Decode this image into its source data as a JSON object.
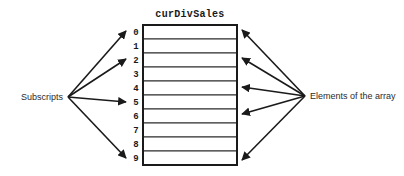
{
  "diagram": {
    "title": "curDivSales",
    "left_label": "Subscripts",
    "right_label": "Elements of the array",
    "subscripts": [
      "0",
      "1",
      "2",
      "3",
      "4",
      "5",
      "6",
      "7",
      "8",
      "9"
    ],
    "cell_count": 10,
    "colors": {
      "background": "#ffffff",
      "outline": "#1a1a1a",
      "cell_border": "#2b2b2b",
      "text": "#1a1a1a",
      "label_text": "#2b2b2b"
    },
    "left_pointer_targets": [
      "0",
      "2",
      "5",
      "9"
    ],
    "right_pointer_targets": [
      "0",
      "2",
      "4",
      "6",
      "9"
    ]
  }
}
